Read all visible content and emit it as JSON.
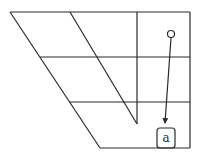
{
  "diagram": {
    "type": "skewed grid with pointer arrow",
    "stroke_color": "#2b2b2b",
    "background": "#ffffff",
    "grid": {
      "rows": 3,
      "outer_left_slant": {
        "x1": 10,
        "y1": 12,
        "x2": 100,
        "y2": 148
      },
      "inner_slant": {
        "x1": 70,
        "y1": 12,
        "x2": 137,
        "y2": 124
      },
      "vertical_divider": {
        "x": 137,
        "y1": 12,
        "y2": 124
      },
      "right_edge_x": 190,
      "horizontal_lines_y": [
        12,
        57,
        102,
        148
      ]
    },
    "start_marker": {
      "shape": "circle",
      "cx": 171,
      "cy": 34,
      "r": 3.5
    },
    "arrow": {
      "x1": 171,
      "y1": 38,
      "x2": 165,
      "y2": 124
    },
    "target_box": {
      "label": "a",
      "x": 157,
      "y": 128,
      "w": 18,
      "h": 20
    }
  }
}
